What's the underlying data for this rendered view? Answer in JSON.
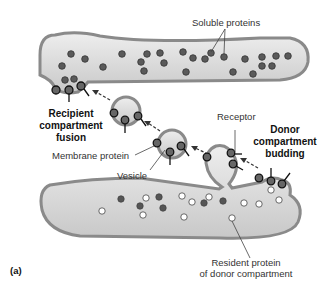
{
  "figure_label": "(a)",
  "labels": {
    "soluble_proteins": "Soluble proteins",
    "recipient_line1": "Recipient",
    "recipient_line2": "compartment",
    "recipient_line3": "fusion",
    "receptor": "Receptor",
    "donor_line1": "Donor",
    "donor_line2": "compartment",
    "donor_line3": "budding",
    "membrane_protein": "Membrane protein",
    "vesicle": "Vesicle",
    "resident_line1": "Resident protein",
    "resident_line2": "of donor compartment"
  },
  "colors": {
    "membrane": "#8a8a8a",
    "lumen": "#d6d6d6",
    "dark_protein": "#555555",
    "light_protein": "#ffffff"
  }
}
